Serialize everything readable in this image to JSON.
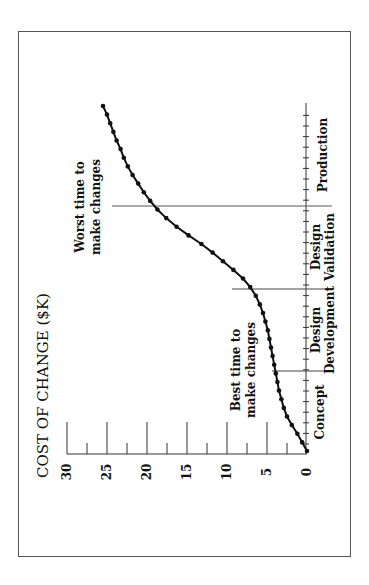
{
  "chart_data": {
    "type": "line",
    "orientation": "rotated-90-ccw",
    "title": "COST OF CHANGE ($K)",
    "xlabel": "",
    "ylabel": "COST OF CHANGE ($K)",
    "ylim": [
      0,
      30
    ],
    "yticks": [
      0,
      5,
      10,
      15,
      20,
      25,
      30
    ],
    "grid": false,
    "legend": null,
    "phases": [
      "Concept",
      "Design Development",
      "Design Validation",
      "Production"
    ],
    "phase_boundaries_x": [
      0,
      10,
      20,
      30,
      43
    ],
    "annotations": [
      {
        "text": "Best time to make changes",
        "x": 10
      },
      {
        "text": "Worst time to make changes",
        "x": 30
      }
    ],
    "series": [
      {
        "name": "Cost of change",
        "x": [
          0,
          1,
          2,
          3,
          4,
          5,
          6,
          7,
          8,
          9,
          10,
          11,
          12,
          13,
          14,
          15,
          16,
          17,
          18,
          19,
          20,
          21,
          22,
          23,
          24,
          25,
          26,
          27,
          28,
          29,
          30,
          31,
          32,
          33,
          34,
          35,
          36,
          37,
          38,
          39,
          40
        ],
        "values": [
          0,
          0.6,
          1.2,
          1.9,
          2.5,
          2.9,
          3.2,
          3.5,
          3.7,
          3.9,
          4.1,
          4.3,
          4.5,
          4.7,
          4.9,
          5.2,
          5.5,
          5.9,
          6.4,
          7.1,
          8.0,
          9.2,
          10.5,
          11.8,
          13.2,
          14.8,
          16.3,
          17.6,
          18.7,
          19.6,
          20.4,
          21.1,
          21.8,
          22.4,
          22.9,
          23.3,
          23.8,
          24.2,
          24.6,
          25.0,
          25.5
        ]
      }
    ]
  },
  "labels": {
    "title": "COST OF CHANGE ($K)",
    "ticks": [
      "0",
      "5",
      "10",
      "15",
      "20",
      "25",
      "30"
    ],
    "phase_concept": "Concept",
    "phase_dd_1": "Design",
    "phase_dd_2": "Development",
    "phase_dv_1": "Design",
    "phase_dv_2": "Validation",
    "phase_prod": "Production",
    "best_1": "Best time to",
    "best_2": "make changes",
    "worst_1": "Worst time to",
    "worst_2": "make changes"
  }
}
